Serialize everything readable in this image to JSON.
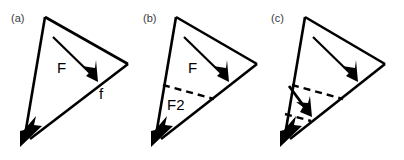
{
  "figure": {
    "background_color": "#ffffff",
    "stroke_color": "#000000",
    "label_color": "#3a3a3a",
    "width": 404,
    "height": 160
  },
  "panels": [
    {
      "id": "panel-a",
      "label": "(a)",
      "label_x": 11,
      "label_y": 22,
      "origin_x": 0,
      "triangle": {
        "apex_x": 45,
        "apex_y": 17,
        "right_x": 128,
        "right_y": 64,
        "bottom_x": 22,
        "bottom_y": 144
      },
      "vectors": [
        {
          "name": "F",
          "label": "F",
          "label_x": 57,
          "label_y": 73,
          "x1": 53,
          "y1": 37,
          "x2": 96,
          "y2": 79,
          "style": "solid"
        },
        {
          "name": "f",
          "label": "f",
          "label_x": 99,
          "label_y": 99,
          "style": "edge-arrow"
        }
      ],
      "dashed_lines": []
    },
    {
      "id": "panel-b",
      "label": "(b)",
      "label_x": 143,
      "label_y": 22,
      "origin_x": 131,
      "triangle": {
        "apex_x": 176,
        "apex_y": 17,
        "right_x": 257,
        "right_y": 64,
        "bottom_x": 153,
        "bottom_y": 144
      },
      "vectors": [
        {
          "name": "F",
          "label": "F",
          "label_x": 188,
          "label_y": 73,
          "x1": 184,
          "y1": 37,
          "x2": 227,
          "y2": 79,
          "style": "solid"
        },
        {
          "name": "F2",
          "label": "F2",
          "label_x": 167,
          "label_y": 110,
          "style": "dashed-annotation"
        }
      ],
      "dashed_lines": [
        {
          "x1": 163,
          "y1": 85,
          "x2": 214,
          "y2": 99
        }
      ]
    },
    {
      "id": "panel-c",
      "label": "(c)",
      "label_x": 271,
      "label_y": 22,
      "origin_x": 260,
      "triangle": {
        "apex_x": 305,
        "apex_y": 17,
        "right_x": 385,
        "right_y": 64,
        "bottom_x": 282,
        "bottom_y": 144
      },
      "vectors": [
        {
          "name": "F",
          "label": "",
          "x1": 313,
          "y1": 37,
          "x2": 356,
          "y2": 79,
          "style": "solid"
        },
        {
          "name": "F2-resultant",
          "label": "",
          "x1": 289,
          "y1": 86,
          "x2": 311,
          "y2": 115,
          "style": "solid"
        }
      ],
      "dashed_lines": [
        {
          "x1": 292,
          "y1": 85,
          "x2": 343,
          "y2": 99
        },
        {
          "x1": 286,
          "y1": 113,
          "x2": 310,
          "y2": 120
        }
      ]
    }
  ]
}
